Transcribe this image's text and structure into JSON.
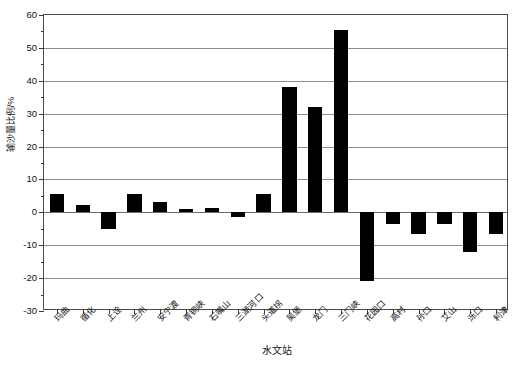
{
  "chart_data": {
    "type": "bar",
    "title": "",
    "xlabel": "水文站",
    "ylabel": "输沙量比例/%",
    "ylim": [
      -30,
      60
    ],
    "yticks": [
      -30,
      -20,
      -10,
      0,
      10,
      20,
      30,
      40,
      50,
      60
    ],
    "ytick_labels": [
      "-30",
      "-20",
      "-10",
      "0",
      "10",
      "20",
      "30",
      "40",
      "50",
      "60"
    ],
    "grid": true,
    "legend": "none",
    "bar_color": "#000000",
    "categories": [
      "玛曲",
      "循化",
      "上诠",
      "兰州",
      "安宁渡",
      "青铜峡",
      "石嘴山",
      "三湖河口",
      "头道拐",
      "吴堡",
      "龙门",
      "三门峡",
      "花园口",
      "高村",
      "孙口",
      "艾山",
      "泺口",
      "利津"
    ],
    "values": [
      5.5,
      2.3,
      -5.0,
      5.5,
      3.0,
      1.0,
      1.2,
      -1.5,
      5.5,
      38.0,
      32.0,
      55.5,
      -21.0,
      -3.5,
      -6.5,
      -3.5,
      -12.0,
      -6.5
    ]
  }
}
